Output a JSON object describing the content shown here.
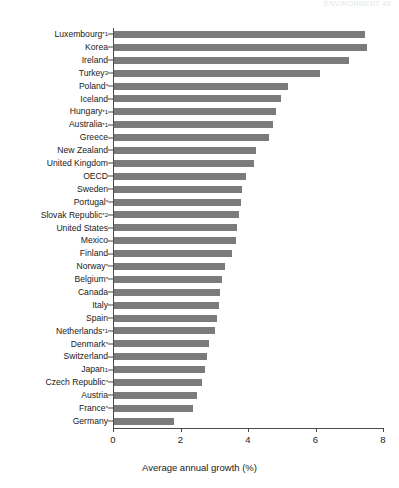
{
  "page_header": "ENVIRONMENT   49",
  "chart_data": {
    "type": "bar",
    "orientation": "horizontal",
    "title": "",
    "xlabel": "Average annual growth (%)",
    "ylabel": "",
    "xlim": [
      0,
      8
    ],
    "xticks": [
      0,
      2,
      4,
      6,
      8
    ],
    "xtick_labels": [
      "0",
      "2",
      "4",
      "6",
      "8"
    ],
    "grid": false,
    "legend": null,
    "bar_color": "#7b7b7b",
    "axis_color": "#4a4a4a",
    "categories": [
      "Luxembourg*1",
      "Korea",
      "Ireland",
      "Turkey3",
      "Poland*",
      "Iceland",
      "Hungary*1",
      "Australia*1",
      "Greece",
      "New Zealand",
      "United Kingdom",
      "OECD",
      "Sweden",
      "Portugal*",
      "Slovak Republic*2",
      "United States",
      "Mexico",
      "Finland",
      "Norway*",
      "Belgium*",
      "Canada",
      "Italy",
      "Spain",
      "Netherlands*1",
      "Denmark*",
      "Switzerland",
      "Japan1",
      "Czech Republic*",
      "Austria",
      "France*",
      "Germany"
    ],
    "values": [
      7.45,
      7.5,
      6.95,
      6.1,
      5.15,
      4.95,
      4.8,
      4.7,
      4.6,
      4.2,
      4.15,
      3.9,
      3.8,
      3.75,
      3.7,
      3.65,
      3.6,
      3.5,
      3.3,
      3.2,
      3.15,
      3.1,
      3.05,
      3.0,
      2.8,
      2.75,
      2.7,
      2.6,
      2.45,
      2.35,
      1.78
    ],
    "bars": [
      {
        "label": "Luxembourg",
        "marker": "*1",
        "value": 7.45
      },
      {
        "label": "Korea",
        "marker": "",
        "value": 7.5
      },
      {
        "label": "Ireland",
        "marker": "",
        "value": 6.95
      },
      {
        "label": "Turkey",
        "marker": "3",
        "value": 6.1
      },
      {
        "label": "Poland",
        "marker": "*",
        "value": 5.15
      },
      {
        "label": "Iceland",
        "marker": "",
        "value": 4.95
      },
      {
        "label": "Hungary",
        "marker": "*1",
        "value": 4.8
      },
      {
        "label": "Australia",
        "marker": "*1",
        "value": 4.7
      },
      {
        "label": "Greece",
        "marker": "",
        "value": 4.6
      },
      {
        "label": "New Zealand",
        "marker": "",
        "value": 4.2
      },
      {
        "label": "United Kingdom",
        "marker": "",
        "value": 4.15
      },
      {
        "label": "OECD",
        "marker": "",
        "value": 3.9
      },
      {
        "label": "Sweden",
        "marker": "",
        "value": 3.8
      },
      {
        "label": "Portugal",
        "marker": "*",
        "value": 3.75
      },
      {
        "label": "Slovak Republic",
        "marker": "*2",
        "value": 3.7
      },
      {
        "label": "United States",
        "marker": "",
        "value": 3.65
      },
      {
        "label": "Mexico",
        "marker": "",
        "value": 3.6
      },
      {
        "label": "Finland",
        "marker": "",
        "value": 3.5
      },
      {
        "label": "Norway",
        "marker": "*",
        "value": 3.3
      },
      {
        "label": "Belgium",
        "marker": "*",
        "value": 3.2
      },
      {
        "label": "Canada",
        "marker": "",
        "value": 3.15
      },
      {
        "label": "Italy",
        "marker": "",
        "value": 3.1
      },
      {
        "label": "Spain",
        "marker": "",
        "value": 3.05
      },
      {
        "label": "Netherlands",
        "marker": "*1",
        "value": 3.0
      },
      {
        "label": "Denmark",
        "marker": "*",
        "value": 2.8
      },
      {
        "label": "Switzerland",
        "marker": "",
        "value": 2.75
      },
      {
        "label": "Japan",
        "marker": "1",
        "value": 2.7
      },
      {
        "label": "Czech Republic",
        "marker": "*",
        "value": 2.6
      },
      {
        "label": "Austria",
        "marker": "",
        "value": 2.45
      },
      {
        "label": "France",
        "marker": "*",
        "value": 2.35
      },
      {
        "label": "Germany",
        "marker": "",
        "value": 1.78
      }
    ]
  }
}
